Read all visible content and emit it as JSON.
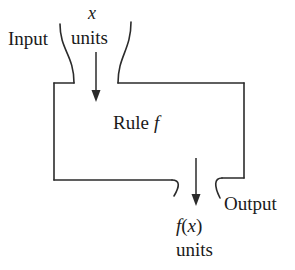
{
  "figure": {
    "stroke_color": "#2b2b2b",
    "background_color": "#ffffff"
  },
  "labels": {
    "input": "Input",
    "input_quantity_symbol": "x",
    "input_units": "units",
    "rule_word": "Rule",
    "rule_function_symbol": "f",
    "output_quantity_symbol_f": "f",
    "output_quantity_symbol_paren_open": "(",
    "output_quantity_symbol_x": "x",
    "output_quantity_symbol_paren_close": ")",
    "output_units": "units",
    "output": "Output"
  },
  "icons": {
    "input_arrow": "arrow-down-icon",
    "output_arrow": "arrow-down-icon",
    "input_funnel": "funnel-icon",
    "output_funnel": "funnel-icon",
    "rule_box": "rectangle-icon"
  }
}
